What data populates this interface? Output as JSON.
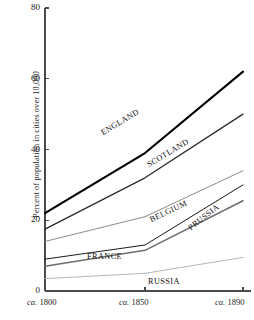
{
  "chart_data": {
    "type": "line",
    "title": "",
    "xlabel": "",
    "ylabel": "Percent of population in cities over 10,000",
    "x": [
      1800,
      1850,
      1890
    ],
    "xtick_labels": [
      "ca. 1800",
      "ca. 1850",
      "ca. 1890"
    ],
    "ytick_labels": [
      "0",
      "20",
      "40",
      "60",
      "80"
    ],
    "ytick_values": [
      0,
      20,
      40,
      60,
      80
    ],
    "ylim": [
      0,
      80
    ],
    "xlim": [
      1800,
      1890
    ],
    "grid": false,
    "legend": "inline-labels",
    "series": [
      {
        "name": "ENGLAND",
        "values": [
          22,
          39,
          62
        ],
        "color": "#000000",
        "width": 2.1,
        "label_x": 104,
        "label_y": 128,
        "label_angle": -31
      },
      {
        "name": "SCOTLAND",
        "values": [
          17.5,
          32,
          50
        ],
        "color": "#2b2b2b",
        "width": 1.3,
        "label_x": 150,
        "label_y": 160,
        "label_angle": -31
      },
      {
        "name": "BELGIUM",
        "values": [
          14,
          21,
          34
        ],
        "color": "#8c8c8c",
        "width": 1.0,
        "label_x": 152,
        "label_y": 215,
        "label_angle": -25
      },
      {
        "name": "PRUSSIA",
        "values": [
          9,
          13,
          30
        ],
        "color": "#1a1a1a",
        "width": 1.0,
        "label_x": 192,
        "label_y": 223,
        "label_angle": -38
      },
      {
        "name": "FRANCE",
        "values": [
          7,
          11.5,
          25.5
        ],
        "color": "#6e6e6e",
        "width": 1.5,
        "label_x": 87,
        "label_y": 252,
        "label_angle": 0
      },
      {
        "name": "RUSSIA",
        "values": [
          3.5,
          5,
          9.5
        ],
        "color": "#b5b5b5",
        "width": 1.0,
        "label_x": 148,
        "label_y": 277,
        "label_angle": 0
      }
    ]
  },
  "axes": {
    "color": "#4a4a4a"
  }
}
